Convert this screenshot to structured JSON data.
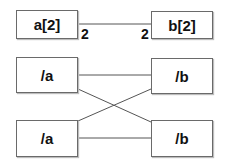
{
  "diagram": {
    "top": {
      "left_box": {
        "label": "a[2]",
        "multiplicity": "2"
      },
      "right_box": {
        "label": "b[2]",
        "multiplicity": "2"
      }
    },
    "bottom": {
      "left_boxes": [
        {
          "label": "/a"
        },
        {
          "label": "/a"
        }
      ],
      "right_boxes": [
        {
          "label": "/b"
        },
        {
          "label": "/b"
        }
      ],
      "connections": [
        {
          "from": "/a (top)",
          "to": "/b (top)"
        },
        {
          "from": "/a (top)",
          "to": "/b (bottom)"
        },
        {
          "from": "/a (bottom)",
          "to": "/b (top)"
        },
        {
          "from": "/a (bottom)",
          "to": "/b (bottom)"
        }
      ]
    },
    "colors": {
      "line": "#555555",
      "border": "#6a6a6a",
      "text": "#111111"
    }
  }
}
